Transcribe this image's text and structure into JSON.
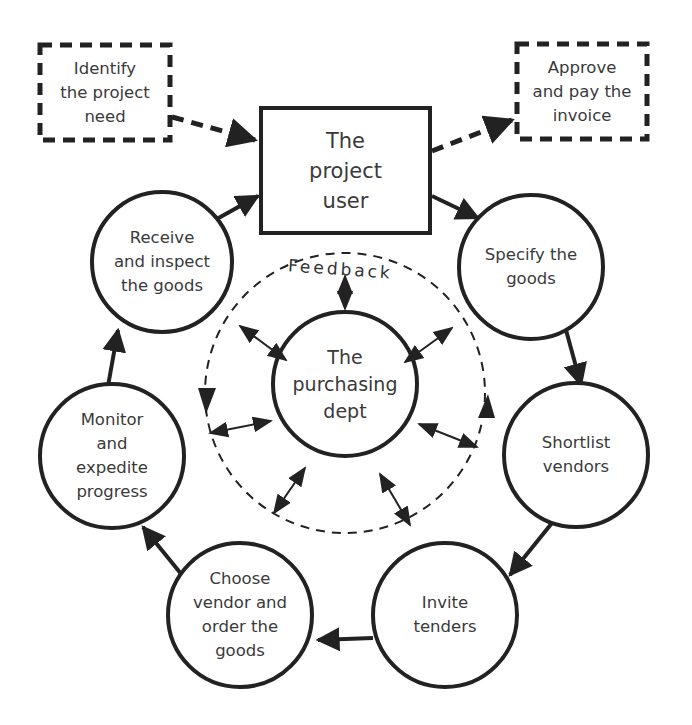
{
  "diagram": {
    "type": "purchasing-cycle",
    "center": {
      "label": "The\npurchasing\ndept"
    },
    "feedback_label": "Feedback",
    "project_user": {
      "label": "The\nproject\nuser"
    },
    "external": {
      "identify_need": "Identify\nthe project\nneed",
      "approve_invoice": "Approve\nand pay the\ninvoice"
    },
    "cycle_steps": [
      {
        "id": "specify",
        "label": "Specify the\ngoods"
      },
      {
        "id": "shortlist",
        "label": "Shortlist\nvendors"
      },
      {
        "id": "invite",
        "label": "Invite\ntenders"
      },
      {
        "id": "choose",
        "label": "Choose\nvendor and\norder the\ngoods"
      },
      {
        "id": "monitor",
        "label": "Monitor\nand\nexpedite\nprogress"
      },
      {
        "id": "receive",
        "label": "Receive\nand inspect\nthe goods"
      }
    ],
    "colors": {
      "stroke": "#222222",
      "text": "#3a3a3a",
      "background": "#ffffff"
    }
  }
}
